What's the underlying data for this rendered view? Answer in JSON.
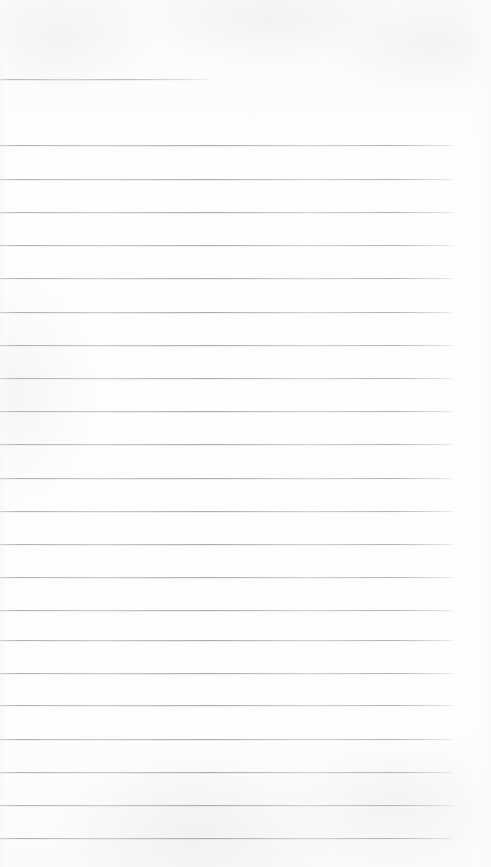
{
  "page": {
    "kind": "scanned-ruled-notepad-page",
    "width": 491,
    "height": 867,
    "paper_color": "#fdfdfd",
    "rule_color": "#a8aaaf",
    "content_text": "",
    "handwriting_text": "",
    "header_text": "",
    "footer_text": ""
  },
  "ruling": {
    "line_count": 23,
    "line_spacing_px": 33.2,
    "line_thickness_px": 1,
    "left_margin_px": 0,
    "right_edge_px": 455,
    "first_line_y_px": 79,
    "last_line_y_px": 838
  },
  "lines": [
    {
      "id": "rule-1",
      "y": 79,
      "x": 0,
      "width": 211,
      "variant": "short"
    },
    {
      "id": "rule-2",
      "y": 145,
      "x": 0,
      "width": 455,
      "variant": "full"
    },
    {
      "id": "rule-3",
      "y": 179,
      "x": 0,
      "width": 455,
      "variant": "full"
    },
    {
      "id": "rule-4",
      "y": 212,
      "x": 0,
      "width": 455,
      "variant": "full"
    },
    {
      "id": "rule-5",
      "y": 245,
      "x": 0,
      "width": 455,
      "variant": "full"
    },
    {
      "id": "rule-6",
      "y": 278,
      "x": 0,
      "width": 455,
      "variant": "full"
    },
    {
      "id": "rule-7",
      "y": 312,
      "x": 0,
      "width": 455,
      "variant": "full"
    },
    {
      "id": "rule-8",
      "y": 345,
      "x": 0,
      "width": 455,
      "variant": "full"
    },
    {
      "id": "rule-9",
      "y": 378,
      "x": 0,
      "width": 455,
      "variant": "full"
    },
    {
      "id": "rule-10",
      "y": 411,
      "x": 0,
      "width": 455,
      "variant": "full"
    },
    {
      "id": "rule-11",
      "y": 444,
      "x": 0,
      "width": 455,
      "variant": "full"
    },
    {
      "id": "rule-12",
      "y": 478,
      "x": 0,
      "width": 455,
      "variant": "full"
    },
    {
      "id": "rule-13",
      "y": 511,
      "x": 0,
      "width": 455,
      "variant": "full"
    },
    {
      "id": "rule-14",
      "y": 544,
      "x": 0,
      "width": 455,
      "variant": "full"
    },
    {
      "id": "rule-15",
      "y": 577,
      "x": 0,
      "width": 455,
      "variant": "full"
    },
    {
      "id": "rule-16",
      "y": 610,
      "x": 0,
      "width": 455,
      "variant": "full"
    },
    {
      "id": "rule-17",
      "y": 640,
      "x": 0,
      "width": 455,
      "variant": "full"
    },
    {
      "id": "rule-18",
      "y": 673,
      "x": 0,
      "width": 455,
      "variant": "full"
    },
    {
      "id": "rule-19",
      "y": 705,
      "x": 0,
      "width": 455,
      "variant": "full"
    },
    {
      "id": "rule-20",
      "y": 739,
      "x": 0,
      "width": 455,
      "variant": "full"
    },
    {
      "id": "rule-21",
      "y": 772,
      "x": 0,
      "width": 455,
      "variant": "full"
    },
    {
      "id": "rule-22",
      "y": 805,
      "x": 0,
      "width": 455,
      "variant": "full"
    },
    {
      "id": "rule-23",
      "y": 838,
      "x": 0,
      "width": 455,
      "variant": "full"
    }
  ]
}
